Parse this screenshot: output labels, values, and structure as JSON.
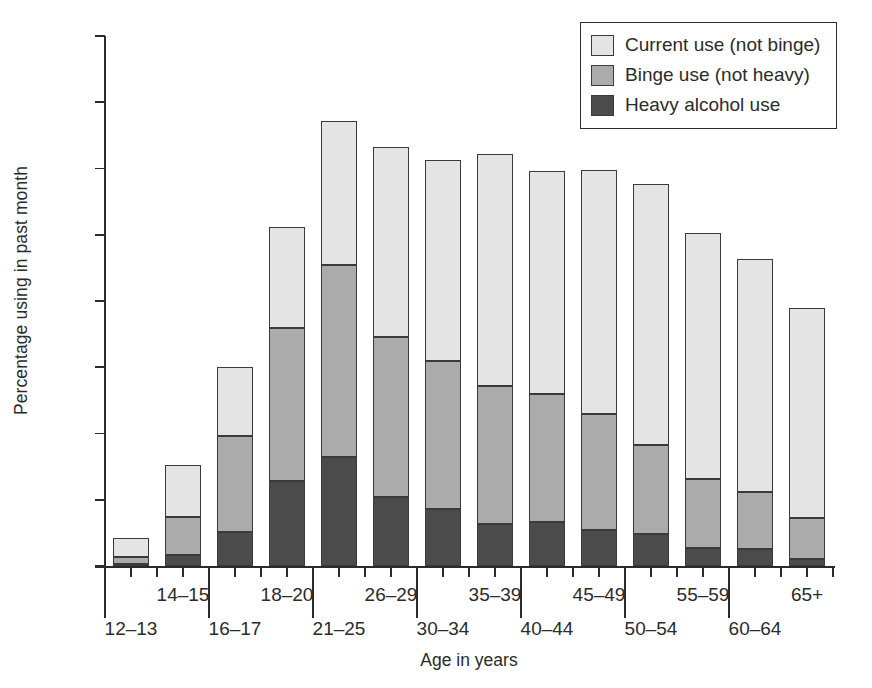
{
  "chart_data": {
    "type": "bar",
    "stacked": true,
    "title": "",
    "xlabel": "Age in years",
    "ylabel": "Percentage using in past month",
    "ylim": [
      0,
      80
    ],
    "yticks": [
      0,
      10,
      20,
      30,
      40,
      50,
      60,
      70,
      80
    ],
    "ytick_labels": [
      "0",
      "10",
      "20",
      "30",
      "40",
      "50",
      "60",
      "70",
      "80"
    ],
    "grid": false,
    "legend_position": "top-right",
    "categories": [
      "12–13",
      "14–15",
      "16–17",
      "18–20",
      "21–25",
      "26–29",
      "30–34",
      "35–39",
      "40–44",
      "45–49",
      "50–54",
      "55–59",
      "60–64",
      "65+"
    ],
    "series": [
      {
        "name": "Heavy alcohol use",
        "color": "#4b4b4b",
        "values": [
          0.3,
          1.6,
          5.1,
          12.9,
          16.5,
          10.4,
          8.6,
          6.3,
          6.6,
          5.4,
          4.8,
          2.7,
          2.6,
          1.0
        ]
      },
      {
        "name": "Binge use (not heavy)",
        "color": "#ababab",
        "values": [
          1.1,
          5.8,
          14.5,
          23.0,
          28.9,
          24.2,
          22.3,
          20.8,
          19.3,
          17.6,
          13.5,
          10.4,
          8.5,
          6.3
        ]
      },
      {
        "name": "Current use (not binge)",
        "color": "#e4e4e4",
        "values": [
          2.9,
          7.8,
          10.4,
          15.2,
          21.8,
          28.7,
          30.4,
          35.1,
          33.8,
          36.8,
          39.4,
          37.1,
          35.3,
          31.7
        ]
      }
    ],
    "totals": [
      4.3,
      15.2,
      30.0,
      51.1,
      67.2,
      63.3,
      61.3,
      62.2,
      59.7,
      59.8,
      57.7,
      50.2,
      46.4,
      39.0
    ]
  },
  "legend": {
    "items": [
      {
        "label": "Current use (not binge)",
        "color": "#e4e4e4"
      },
      {
        "label": "Binge use (not heavy)",
        "color": "#ababab"
      },
      {
        "label": "Heavy alcohol use",
        "color": "#4b4b4b"
      }
    ]
  },
  "axes": {
    "y_title": "Percentage using in past month",
    "x_title": "Age in years"
  }
}
